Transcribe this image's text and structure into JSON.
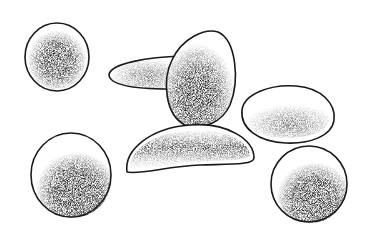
{
  "illustration": {
    "style": "stipple ink drawing",
    "background": "#ffffff",
    "ink": "#1a1a1a",
    "objects": [
      {
        "id": "cell-round-top-left",
        "shape": "circle",
        "cx": 57,
        "cy": 57,
        "rx": 32,
        "ry": 33,
        "shade": "center"
      },
      {
        "id": "cell-flat-elongated",
        "shape": "lens",
        "cx": 150,
        "cy": 72,
        "rx": 42,
        "ry": 15,
        "shade": "light"
      },
      {
        "id": "cell-egg-upright",
        "shape": "egg",
        "cx": 200,
        "cy": 78,
        "rx": 35,
        "ry": 48,
        "shade": "bottom-heavy"
      },
      {
        "id": "cell-oval-right",
        "shape": "oval",
        "cx": 287,
        "cy": 114,
        "rx": 47,
        "ry": 29,
        "shade": "light-lower"
      },
      {
        "id": "cell-crescent-bottom",
        "shape": "crescent",
        "cx": 190,
        "cy": 150,
        "rx": 64,
        "ry": 25,
        "shade": "band"
      },
      {
        "id": "cell-round-bottom-left",
        "shape": "circle",
        "cx": 71,
        "cy": 175,
        "rx": 40,
        "ry": 42,
        "shade": "lower-right"
      },
      {
        "id": "cell-round-bottom-right",
        "shape": "circle",
        "cx": 309,
        "cy": 184,
        "rx": 38,
        "ry": 38,
        "shade": "lower"
      }
    ]
  }
}
